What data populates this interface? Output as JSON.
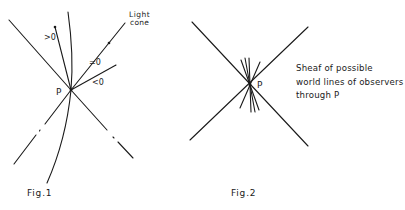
{
  "figures": [
    {
      "id": "fig1",
      "caption": "Fig.1",
      "point_label": "P",
      "light_cone_label_line1": "Light",
      "light_cone_label_line2": "cone",
      "labels": {
        "greater": ">0",
        "equal": "=0",
        "less": "<0"
      }
    },
    {
      "id": "fig2",
      "caption": "Fig.2",
      "point_label": "P",
      "description_lines": [
        "Sheaf of possible",
        "world lines of observers",
        "through P"
      ]
    }
  ]
}
